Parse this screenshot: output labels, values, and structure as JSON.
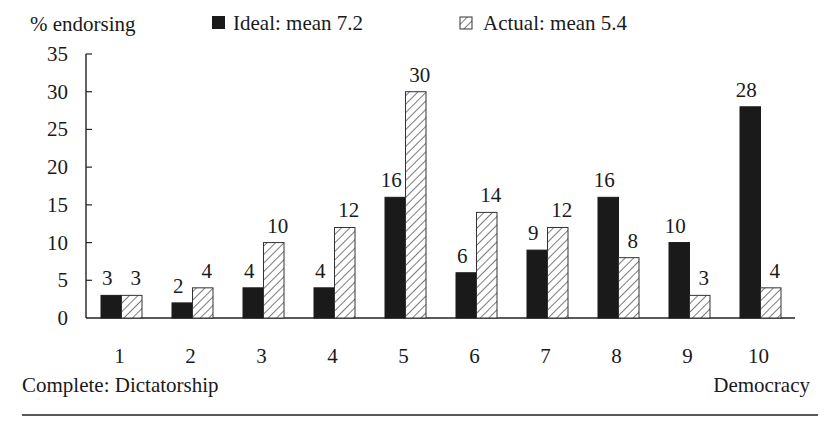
{
  "chart_data": {
    "type": "bar",
    "title": "",
    "ylabel": "% endorsing",
    "xlabel_left": "Complete: Dictatorship",
    "xlabel_right": "Democracy",
    "categories": [
      "1",
      "2",
      "3",
      "4",
      "5",
      "6",
      "7",
      "8",
      "9",
      "10"
    ],
    "series": [
      {
        "name": "Ideal: mean 7.2",
        "fill": "solid",
        "color": "#1a1a1a",
        "values": [
          3,
          2,
          4,
          4,
          16,
          6,
          9,
          16,
          10,
          28
        ]
      },
      {
        "name": "Actual: mean 5.4",
        "fill": "hatched",
        "color": "#ffffff",
        "values": [
          3,
          4,
          10,
          12,
          30,
          14,
          12,
          8,
          3,
          4
        ]
      }
    ],
    "yticks": [
      0,
      5,
      10,
      15,
      20,
      25,
      30,
      35
    ],
    "ylim": [
      0,
      35
    ],
    "grid": false,
    "legend_position": "top",
    "data_labels": true
  }
}
